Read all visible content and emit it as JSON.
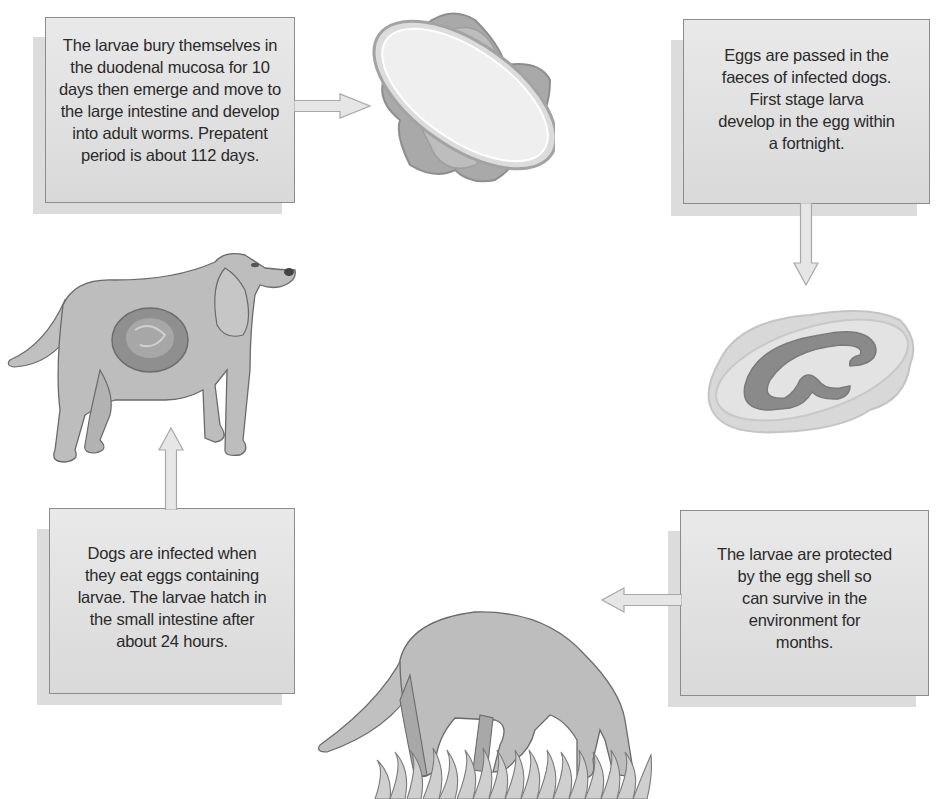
{
  "diagram": {
    "type": "life-cycle",
    "colors": {
      "box_fill": "#dedede",
      "box_border": "#8c8c8c",
      "box_shadow": "#dcdcdc",
      "arrow_fill": "#e6e6e6",
      "arrow_stroke": "#a8a8a8",
      "dog_fill": "#bdbdbd",
      "text": "#2a2a2a"
    },
    "steps": [
      {
        "id": "step-adult-development",
        "position": "top-left",
        "text_lines": [
          "The larvae bury themselves in",
          "the duodenal mucosa for 10",
          "days then emerge and move to",
          "the large intestine and develop",
          "into adult worms. Prepatent",
          "period is about 112 days."
        ]
      },
      {
        "id": "step-eggs-passed",
        "position": "top-right",
        "text_lines": [
          "Eggs are passed in the",
          "faeces of infected dogs.",
          "First stage larva",
          "develop in the egg within",
          "a fortnight."
        ]
      },
      {
        "id": "step-infection",
        "position": "bottom-left",
        "text_lines": [
          "Dogs are infected when",
          "they eat eggs containing",
          "larvae. The larvae hatch in",
          "the small intestine after",
          "about 24 hours."
        ]
      },
      {
        "id": "step-environment-survival",
        "position": "bottom-right",
        "text_lines": [
          "The larvae are protected",
          "by the egg shell so",
          "can survive in the",
          "environment for",
          "months."
        ]
      }
    ],
    "illustrations": [
      {
        "id": "unembryonated-egg",
        "position": "top-center",
        "description": "lemon-shaped egg with polar plugs"
      },
      {
        "id": "embryonated-egg",
        "position": "right-middle",
        "description": "egg containing coiled larva"
      },
      {
        "id": "infected-dog",
        "position": "left-middle",
        "description": "standing dog with highlighted intestine"
      },
      {
        "id": "grazing-dog",
        "position": "bottom-center",
        "description": "dog sniffing/eating in grass"
      }
    ],
    "arrows": [
      {
        "from": "step-adult-development",
        "to": "unembryonated-egg",
        "direction": "right"
      },
      {
        "from": "step-eggs-passed",
        "to": "embryonated-egg",
        "direction": "down"
      },
      {
        "from": "step-environment-survival",
        "to": "grazing-dog",
        "direction": "left"
      },
      {
        "from": "step-infection",
        "to": "infected-dog",
        "direction": "up"
      }
    ]
  }
}
